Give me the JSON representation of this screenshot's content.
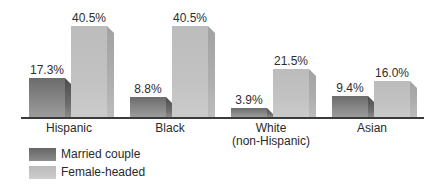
{
  "chart_data": {
    "type": "bar",
    "title": "",
    "xlabel": "",
    "ylabel": "",
    "ylim": [
      0,
      45
    ],
    "grid": false,
    "legend_position": "bottom-left",
    "categories": [
      "Hispanic",
      "Black",
      "White\n(non-Hispanic)",
      "Asian"
    ],
    "category_lines": [
      [
        "Hispanic"
      ],
      [
        "Black"
      ],
      [
        "White",
        "(non-Hispanic)"
      ],
      [
        "Asian"
      ]
    ],
    "series": [
      {
        "name": "Married couple",
        "values": [
          17.3,
          8.8,
          3.9,
          9.4
        ],
        "labels": [
          "17.3%",
          "8.8%",
          "3.9%",
          "9.4%"
        ],
        "color": "#7a7a7a"
      },
      {
        "name": "Female-headed",
        "values": [
          40.5,
          40.5,
          21.5,
          16.0
        ],
        "labels": [
          "40.5%",
          "40.5%",
          "21.5%",
          "16.0%"
        ],
        "color": "#c0c0c0"
      }
    ],
    "units": "%"
  },
  "legend": {
    "items": [
      {
        "label": "Married couple",
        "key": "married"
      },
      {
        "label": "Female-headed",
        "key": "female"
      }
    ]
  }
}
